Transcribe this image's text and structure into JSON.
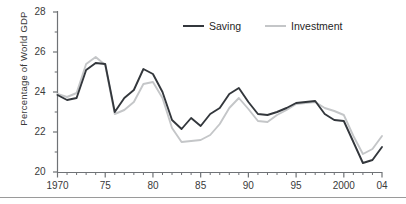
{
  "chart_data": {
    "type": "line",
    "title": "",
    "xlabel": "",
    "ylabel": "Percentage of  World GDP",
    "xlim": [
      1970,
      2004
    ],
    "ylim": [
      20,
      28
    ],
    "yticks": [
      20,
      22,
      24,
      26,
      28
    ],
    "ytick_labels": [
      "20",
      "22",
      "24",
      "26",
      "28"
    ],
    "xticks": [
      1970,
      1975,
      1980,
      1985,
      1990,
      1995,
      2000,
      2004
    ],
    "xtick_labels": [
      "1970",
      "75",
      "80",
      "85",
      "90",
      "95",
      "2000",
      "04"
    ],
    "minor_xticks_every": 1,
    "grid": false,
    "legend_position": "top-center",
    "x": [
      1970,
      1971,
      1972,
      1973,
      1974,
      1975,
      1976,
      1977,
      1978,
      1979,
      1980,
      1981,
      1982,
      1983,
      1984,
      1985,
      1986,
      1987,
      1988,
      1989,
      1990,
      1991,
      1992,
      1993,
      1994,
      1995,
      1996,
      1997,
      1998,
      1999,
      2000,
      2001,
      2002,
      2003,
      2004
    ],
    "series": [
      {
        "name": "Saving",
        "color": "#33373c",
        "values": [
          23.85,
          23.6,
          23.7,
          25.1,
          25.45,
          25.4,
          23.0,
          23.7,
          24.1,
          25.15,
          24.9,
          24.0,
          22.6,
          22.15,
          22.7,
          22.3,
          22.9,
          23.2,
          23.9,
          24.2,
          23.5,
          22.9,
          22.85,
          23.0,
          23.2,
          23.45,
          23.5,
          23.55,
          22.9,
          22.6,
          22.55,
          21.5,
          20.45,
          20.6,
          21.25
        ]
      },
      {
        "name": "Investment",
        "color": "#c4c6c8",
        "values": [
          23.9,
          23.75,
          23.95,
          25.4,
          25.75,
          25.35,
          22.9,
          23.1,
          23.5,
          24.4,
          24.5,
          23.7,
          22.2,
          21.5,
          21.55,
          21.6,
          21.85,
          22.4,
          23.2,
          23.7,
          23.15,
          22.55,
          22.5,
          22.85,
          23.1,
          23.4,
          23.45,
          23.5,
          23.2,
          23.05,
          22.85,
          21.8,
          20.9,
          21.15,
          21.8
        ]
      }
    ]
  },
  "legend": {
    "items": [
      {
        "label": "Saving",
        "color": "#33373c"
      },
      {
        "label": "Investment",
        "color": "#c4c6c8"
      }
    ]
  }
}
